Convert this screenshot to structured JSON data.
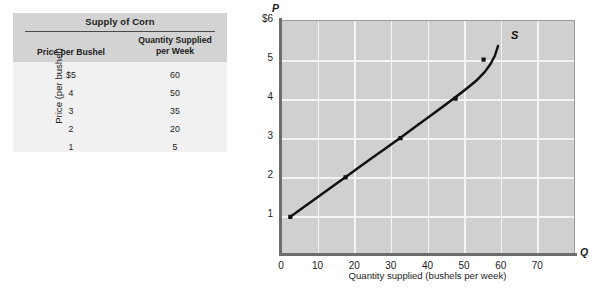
{
  "table": {
    "title": "Supply of Corn",
    "columns": [
      "Price per Bushel",
      "Quantity Supplied per Week"
    ],
    "column_price_label": "Price per Bushel",
    "column_qty_line1": "Quantity Supplied",
    "column_qty_line2": "per Week",
    "rows": [
      {
        "price": "$5",
        "quantity": "60"
      },
      {
        "price": "4",
        "quantity": "50"
      },
      {
        "price": "3",
        "quantity": "35"
      },
      {
        "price": "2",
        "quantity": "20"
      },
      {
        "price": "1",
        "quantity": "5"
      }
    ]
  },
  "chart_data": {
    "type": "line",
    "title": "",
    "xlabel": "Quantity supplied (bushels per week)",
    "ylabel": "Price (per bushel)",
    "x_axis_letter": "Q",
    "y_axis_letter": "P",
    "xlim": [
      0,
      80
    ],
    "ylim": [
      0,
      6
    ],
    "xticks": [
      "0",
      "10",
      "20",
      "30",
      "40",
      "50",
      "60",
      "70"
    ],
    "xtick_values": [
      0,
      10,
      20,
      30,
      40,
      50,
      60,
      70
    ],
    "yticks": [
      "1",
      "2",
      "3",
      "4",
      "5",
      "$6"
    ],
    "ytick_values": [
      1,
      2,
      3,
      4,
      5,
      6
    ],
    "grid": true,
    "legend": "none",
    "series": [
      {
        "name": "S",
        "label": "S",
        "color": "#111111",
        "x": [
          5,
          20,
          35,
          50,
          60
        ],
        "y": [
          1,
          2,
          3,
          4,
          5
        ],
        "markers": true
      }
    ],
    "annotations": [
      {
        "text": "S",
        "x": 63,
        "y": 5.5
      }
    ],
    "colors": {
      "plot_background": "#d0d0d0",
      "gridline": "#f4f4f4",
      "axis": "#6d6d6d",
      "curve": "#111111",
      "table_header_background": "#d3d3d3",
      "table_body_background": "#f1f1f1"
    }
  }
}
